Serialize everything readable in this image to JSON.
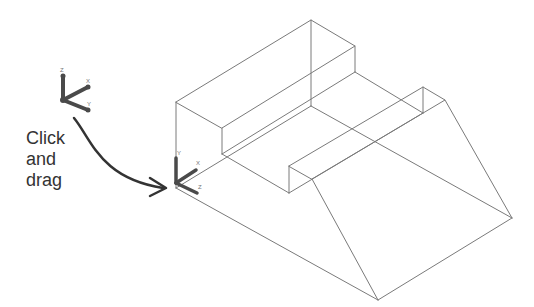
{
  "caption": {
    "line1": "Click",
    "line2": "and",
    "line3": "drag"
  },
  "ucs_before": {
    "axis_labels": {
      "up": "Z",
      "upper_right": "X",
      "lower_right": "Y"
    }
  },
  "ucs_after": {
    "axis_labels": {
      "up": "Y",
      "upper_right": "X",
      "lower_right": "Z"
    }
  },
  "colors": {
    "wire": "#7a7a7a",
    "icon": "#4a4a4a",
    "arrow": "#333333",
    "text": "#333333"
  }
}
